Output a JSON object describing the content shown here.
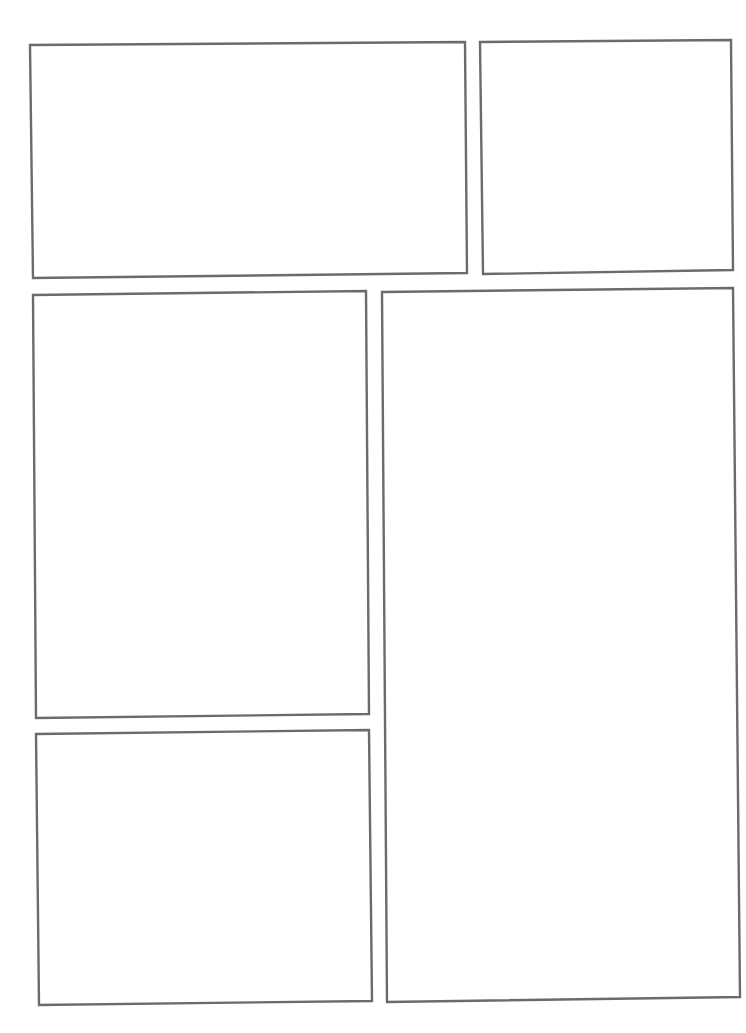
{
  "page": {
    "type": "comic-page-template",
    "background": "#ffffff",
    "border_color": "#6b6b6b",
    "panel_count": 5
  },
  "panels": [
    {
      "id": 1,
      "label": "",
      "points": "30,45 465,42 467,273 33,278"
    },
    {
      "id": 2,
      "label": "",
      "points": "480,42 731,40 733,270 483,274"
    },
    {
      "id": 3,
      "label": "",
      "points": "33,295 366,291 369,714 36,718"
    },
    {
      "id": 4,
      "label": "",
      "points": "36,734 369,730 372,1001 39,1005"
    },
    {
      "id": 5,
      "label": "",
      "points": "382,292 733,288 740,997 387,1002"
    }
  ]
}
